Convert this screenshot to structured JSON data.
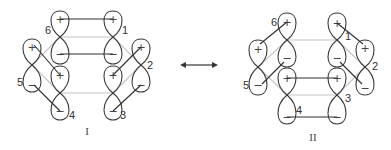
{
  "colors": {
    "orbital_outline": "#3a3a3a",
    "pi_bond": "#2e2e2e",
    "sigma_ring": "#c4c4c4",
    "text": "#333333"
  },
  "structures": [
    {
      "id": "I",
      "label": "I",
      "label_pos": [
        87,
        131
      ],
      "orbitals": [
        {
          "num": "1",
          "x": 113,
          "node": 37,
          "top": 11,
          "bottom": 64,
          "plus_y": 19,
          "minus_y": 54,
          "label_pos": [
            125,
            30
          ]
        },
        {
          "num": "2",
          "x": 141,
          "node": 65,
          "top": 39,
          "bottom": 92,
          "plus_y": 47,
          "minus_y": 85,
          "label_pos": [
            150,
            65
          ]
        },
        {
          "num": "3",
          "x": 113,
          "node": 93,
          "top": 66,
          "bottom": 120,
          "plus_y": 75,
          "minus_y": 111,
          "label_pos": [
            123,
            115
          ]
        },
        {
          "num": "4",
          "x": 60,
          "node": 93,
          "top": 66,
          "bottom": 120,
          "plus_y": 75,
          "minus_y": 111,
          "label_pos": [
            72,
            115
          ]
        },
        {
          "num": "5",
          "x": 32,
          "node": 65,
          "top": 39,
          "bottom": 92,
          "plus_y": 47,
          "minus_y": 85,
          "label_pos": [
            20,
            82
          ]
        },
        {
          "num": "6",
          "x": 60,
          "node": 37,
          "top": 11,
          "bottom": 64,
          "plus_y": 19,
          "minus_y": 54,
          "label_pos": [
            48,
            30
          ]
        }
      ],
      "pi_bonds": [
        {
          "from": [
            60,
            19
          ],
          "to": [
            113,
            19
          ],
          "desc": "6+ to 1+"
        },
        {
          "from": [
            60,
            54
          ],
          "to": [
            113,
            54
          ],
          "desc": "6- to 1-"
        },
        {
          "from": [
            34,
            45
          ],
          "to": [
            60,
            75
          ],
          "desc": "5+ to 4+"
        },
        {
          "from": [
            34,
            85
          ],
          "to": [
            60,
            111
          ],
          "desc": "5- to 4-"
        },
        {
          "from": [
            141,
            47
          ],
          "to": [
            113,
            75
          ],
          "desc": "2+ to 3+"
        },
        {
          "from": [
            141,
            85
          ],
          "to": [
            113,
            111
          ],
          "desc": "2- to 3-"
        }
      ],
      "ring_edges": [
        {
          "from": [
            60,
            37
          ],
          "to": [
            113,
            37
          ]
        },
        {
          "from": [
            113,
            37
          ],
          "to": [
            141,
            65
          ]
        },
        {
          "from": [
            141,
            65
          ],
          "to": [
            113,
            93
          ]
        },
        {
          "from": [
            113,
            93
          ],
          "to": [
            60,
            93
          ]
        },
        {
          "from": [
            60,
            93
          ],
          "to": [
            32,
            65
          ]
        },
        {
          "from": [
            32,
            65
          ],
          "to": [
            60,
            37
          ]
        }
      ]
    },
    {
      "id": "II",
      "label": "II",
      "label_pos": [
        313,
        137
      ],
      "orbitals": [
        {
          "num": "1",
          "x": 337,
          "node": 40,
          "top": 13,
          "bottom": 67,
          "plus_y": 23,
          "minus_y": 58,
          "label_pos": [
            348,
            36
          ]
        },
        {
          "num": "2",
          "x": 365,
          "node": 67,
          "top": 40,
          "bottom": 95,
          "plus_y": 48,
          "minus_y": 88,
          "label_pos": [
            375,
            66
          ]
        },
        {
          "num": "3",
          "x": 337,
          "node": 95,
          "top": 68,
          "bottom": 124,
          "plus_y": 78,
          "minus_y": 117,
          "label_pos": [
            348,
            98
          ]
        },
        {
          "num": "4",
          "x": 287,
          "node": 95,
          "top": 68,
          "bottom": 124,
          "plus_y": 78,
          "minus_y": 117,
          "label_pos": [
            299,
            110
          ]
        },
        {
          "num": "5",
          "x": 258,
          "node": 67,
          "top": 40,
          "bottom": 95,
          "plus_y": 49,
          "minus_y": 85,
          "label_pos": [
            246,
            85
          ]
        },
        {
          "num": "6",
          "x": 287,
          "node": 40,
          "top": 13,
          "bottom": 67,
          "plus_y": 22,
          "minus_y": 58,
          "label_pos": [
            274,
            22
          ]
        }
      ],
      "pi_bonds": [
        {
          "from": [
            287,
            22
          ],
          "to": [
            260,
            44
          ],
          "desc": "6+ to 5+"
        },
        {
          "from": [
            284,
            62
          ],
          "to": [
            262,
            84
          ],
          "desc": "6- to 5-"
        },
        {
          "from": [
            337,
            23
          ],
          "to": [
            363,
            44
          ],
          "desc": "1+ to 2+"
        },
        {
          "from": [
            340,
            62
          ],
          "to": [
            362,
            84
          ],
          "desc": "1- to 2-"
        },
        {
          "from": [
            287,
            78
          ],
          "to": [
            337,
            78
          ],
          "desc": "4+ to 3+"
        },
        {
          "from": [
            287,
            117
          ],
          "to": [
            337,
            117
          ],
          "desc": "4- to 3-"
        }
      ],
      "ring_edges": [
        {
          "from": [
            287,
            40
          ],
          "to": [
            337,
            40
          ]
        },
        {
          "from": [
            337,
            40
          ],
          "to": [
            365,
            67
          ]
        },
        {
          "from": [
            365,
            67
          ],
          "to": [
            337,
            95
          ]
        },
        {
          "from": [
            337,
            95
          ],
          "to": [
            287,
            95
          ]
        },
        {
          "from": [
            287,
            95
          ],
          "to": [
            258,
            67
          ]
        },
        {
          "from": [
            258,
            67
          ],
          "to": [
            287,
            40
          ]
        }
      ]
    }
  ],
  "resonance_arrow": {
    "x1": 180,
    "x2": 218,
    "y": 65,
    "symbol": "↔"
  },
  "signs": {
    "plus": "+",
    "minus": "−"
  }
}
